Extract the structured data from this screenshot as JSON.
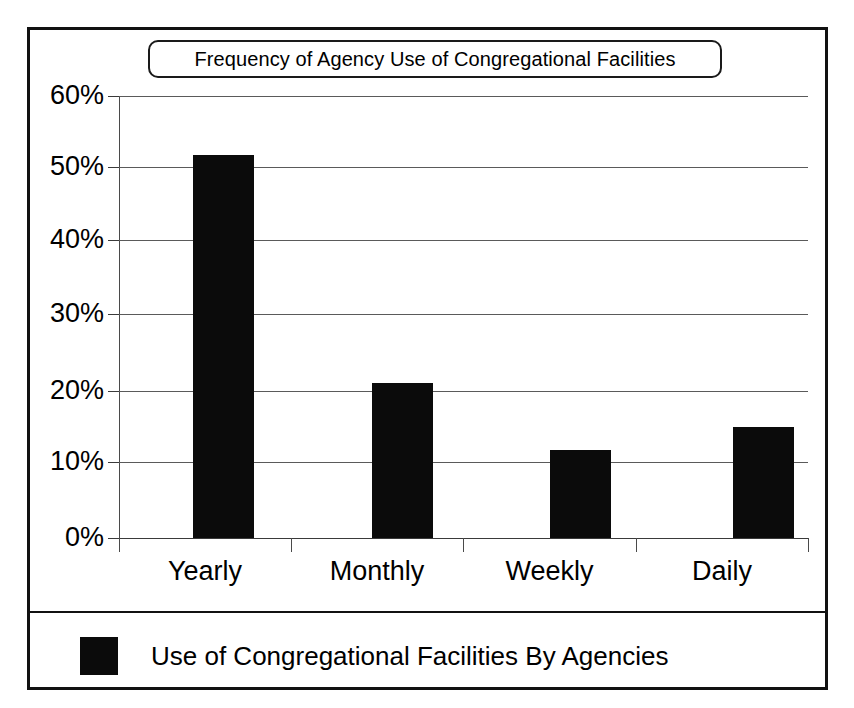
{
  "chart_data": {
    "type": "bar",
    "title": "Frequency of Agency Use of Congregational Facilities",
    "xlabel": "",
    "ylabel": "",
    "categories": [
      "Yearly",
      "Monthly",
      "Weekly",
      "Daily"
    ],
    "values": [
      52,
      21,
      12,
      15
    ],
    "value_unit": "%",
    "ylim": [
      0,
      60
    ],
    "ytick_labels": [
      "60%",
      "50%",
      "40%",
      "30%",
      "20%",
      "10%",
      "0%"
    ],
    "ytick_values": [
      60,
      50,
      40,
      30,
      20,
      10,
      0
    ],
    "grid": true,
    "grid_axis": "y",
    "legend": {
      "position": "bottom",
      "entries": [
        {
          "label": "Use of Congregational Facilities By Agencies",
          "color": "#0b0b0b"
        }
      ]
    },
    "series": [
      {
        "name": "Use of Congregational Facilities By Agencies",
        "color": "#0b0b0b",
        "values": [
          52,
          21,
          12,
          15
        ]
      }
    ]
  },
  "colors": {
    "bar": "#0b0b0b",
    "frame": "#111111",
    "grid": "#5a5a5a",
    "text": "#000000",
    "background": "#ffffff"
  }
}
